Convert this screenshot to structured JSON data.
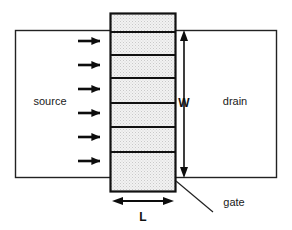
{
  "figure": {
    "background_color": "#ffffff",
    "width": 292,
    "height": 230
  },
  "labels": {
    "source": "source",
    "drain": "drain",
    "gate": "gate",
    "width_dimension": "W",
    "length_dimension": "L"
  },
  "colors": {
    "outline": "#222222",
    "gate_outline": "#111111",
    "gate_fill": "#ececec",
    "arrow": "#0d0d0d",
    "text": "#1a1a1a"
  },
  "geometry": {
    "body_rect": {
      "x": 15,
      "y": 30,
      "width": 262,
      "height": 148
    },
    "gate_rect": {
      "x": 110,
      "y": 13,
      "width": 66,
      "height": 179
    },
    "gate_divider_y": [
      32,
      55,
      78,
      103,
      127,
      152
    ],
    "current_arrow_y": [
      41,
      65,
      89,
      113,
      137,
      161
    ],
    "current_arrow_x_start": 78,
    "current_arrow_x_end": 108,
    "w_dimension": {
      "x": 184,
      "y_top": 30,
      "y_bottom": 178
    },
    "l_dimension": {
      "y": 201,
      "x_left": 112,
      "x_right": 174
    },
    "gate_leader_line": {
      "x1": 176,
      "y1": 181,
      "x2": 213,
      "y2": 212
    }
  },
  "label_positions": {
    "source": {
      "x": 50,
      "y": 105
    },
    "drain": {
      "x": 235,
      "y": 105
    },
    "gate": {
      "x": 234,
      "y": 206
    },
    "width_dimension": {
      "x": 184,
      "y": 107
    },
    "length_dimension": {
      "x": 143,
      "y": 220
    }
  },
  "counts": {
    "gate_segments": 7,
    "current_arrows": 6
  }
}
